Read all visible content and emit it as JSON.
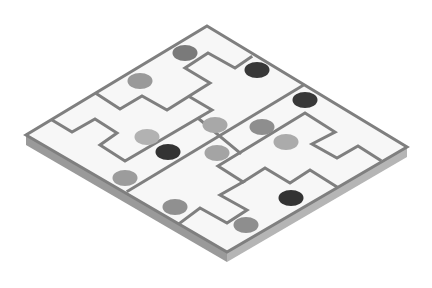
{
  "puzzle": {
    "type": "isometric-region-board",
    "colors": {
      "top_face": "#f7f7f7",
      "side_left": "#9a9a9a",
      "side_right": "#b5b5b5",
      "wall": "#7f7f7f"
    },
    "board": {
      "top": [
        207,
        26
      ],
      "right": [
        407,
        147
      ],
      "bottom": [
        227,
        252
      ],
      "left": [
        26,
        135
      ],
      "thickness": 10
    },
    "walls": [
      {
        "id": "main-diagonal",
        "points": [
          [
            302,
            86
          ],
          [
            128,
            191
          ]
        ]
      },
      {
        "id": "upper-wall",
        "points": [
          [
            251,
            57
          ],
          [
            235,
            68
          ],
          [
            208,
            53
          ],
          [
            185,
            68
          ],
          [
            210,
            83
          ],
          [
            167,
            110
          ],
          [
            142,
            96
          ],
          [
            120,
            109
          ],
          [
            97,
            94
          ]
        ]
      },
      {
        "id": "left-wall",
        "points": [
          [
            52,
            120
          ],
          [
            72,
            132
          ],
          [
            95,
            119
          ],
          [
            117,
            133
          ],
          [
            100,
            145
          ],
          [
            125,
            161
          ],
          [
            212,
            110
          ],
          [
            190,
            97
          ]
        ]
      },
      {
        "id": "center-connector",
        "points": [
          [
            199,
            119
          ],
          [
            240,
            153
          ]
        ]
      },
      {
        "id": "lower-wall",
        "points": [
          [
            380,
            160
          ],
          [
            358,
            146
          ],
          [
            337,
            158
          ],
          [
            312,
            144
          ],
          [
            335,
            132
          ],
          [
            305,
            113
          ],
          [
            218,
            166
          ],
          [
            243,
            182
          ],
          [
            220,
            195
          ],
          [
            247,
            210
          ],
          [
            227,
            223
          ],
          [
            200,
            208
          ],
          [
            180,
            223
          ]
        ]
      },
      {
        "id": "lower-right-wall",
        "points": [
          [
            243,
            182
          ],
          [
            265,
            168
          ],
          [
            290,
            183
          ],
          [
            310,
            170
          ],
          [
            337,
            187
          ]
        ]
      }
    ],
    "pieces": [
      {
        "id": 1,
        "cx": 185,
        "cy": 53,
        "shade": "medium-dark",
        "color": "#7a7a7a"
      },
      {
        "id": 2,
        "cx": 257,
        "cy": 70,
        "shade": "black",
        "color": "#383838"
      },
      {
        "id": 3,
        "cx": 140,
        "cy": 81,
        "shade": "medium",
        "color": "#999999"
      },
      {
        "id": 4,
        "cx": 305,
        "cy": 100,
        "shade": "black",
        "color": "#383838"
      },
      {
        "id": 5,
        "cx": 215,
        "cy": 125,
        "shade": "light",
        "color": "#a8a8a8"
      },
      {
        "id": 6,
        "cx": 262,
        "cy": 127,
        "shade": "medium",
        "color": "#8e8e8e"
      },
      {
        "id": 7,
        "cx": 147,
        "cy": 137,
        "shade": "light",
        "color": "#b2b2b2"
      },
      {
        "id": 8,
        "cx": 286,
        "cy": 142,
        "shade": "light",
        "color": "#ababab"
      },
      {
        "id": 9,
        "cx": 168,
        "cy": 152,
        "shade": "black",
        "color": "#333333"
      },
      {
        "id": 10,
        "cx": 217,
        "cy": 153,
        "shade": "light",
        "color": "#a4a4a4"
      },
      {
        "id": 11,
        "cx": 125,
        "cy": 178,
        "shade": "medium",
        "color": "#9c9c9c"
      },
      {
        "id": 12,
        "cx": 175,
        "cy": 207,
        "shade": "medium",
        "color": "#909090"
      },
      {
        "id": 13,
        "cx": 291,
        "cy": 198,
        "shade": "black",
        "color": "#333333"
      },
      {
        "id": 14,
        "cx": 246,
        "cy": 225,
        "shade": "medium",
        "color": "#8e8e8e"
      }
    ]
  }
}
